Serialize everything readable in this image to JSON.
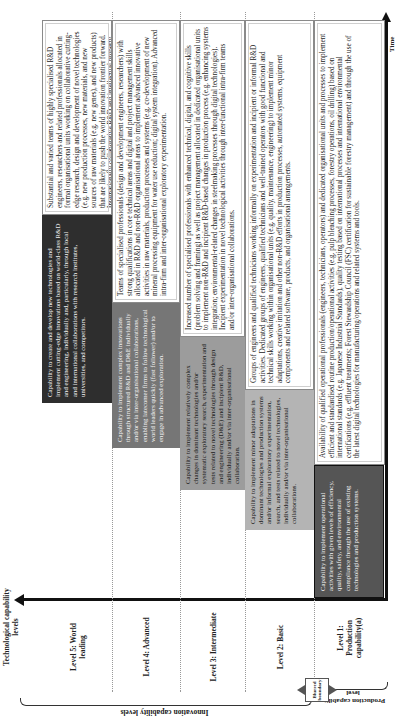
{
  "axes": {
    "y_title": "Technological capability levels",
    "x_title": "Time"
  },
  "levels": [
    {
      "id": 5,
      "label": "Level 5: World leading",
      "capability": "Capability to create and develop new technologies and implement cutting-edge innovations based on world-class R&D and engineering, individually and, particularly, through local and international collaborations with research institutes, universities, and competitors.",
      "description": "Substantial and varied teams of highly specialised R&D engineers, researchers and related professionals allocated in formal organisational units working on collaborative cutting-edge research, design and development of novel technologies (e.g. new production processes, new materials, and new sources of raw materials (e.g. new genes), and new products) that are likely to push the world innovation frontier forward. Internationally collaborative R&D and intellectual property structures."
    },
    {
      "id": 4,
      "label": "Level 4: Advanced",
      "capability": "Capability to implement complex innovations through structured R&D and D&E individually and/or via inter-organisational collaborations, enabling latecomer firms to follow technological world leaders quickly (fast follower) and/or to engage in advanced exploration.",
      "description": "Teams of specialised professionals (design and development engineers, researchers) with strong qualifications in core technical areas and digital and project management skills allocated in R&D and non-R&D organisational areas to implement advanced innovative activities in raw materials, production processes and systems (e.g. co-development of new mineral processing equipment for water use reduction; digital system integration). Advanced intra-firm and inter-organisational exploratory experimentation."
    },
    {
      "id": 3,
      "label": "Level 3: Intermediate",
      "capability": "Capability to implement relatively complex changes in dominant technologies and/or systematic exploratory search, experimentation and tests related to novel technologies through design and engineering (D&E) and incipient R&D, individually and/or via inter-organisational collaboration.",
      "description": "Increased number of specialised professionals with enhanced technical, digital, and cognitive skills (problem solving and framing) as well as project management allocated in dedicated organisational units to implement non-R&D and incipient R&D-based changes in production process (e.g. enhancing systems integration; environmental-related changes in steelmaking processes through digital technologies). Incipient experimentation in novel technological activities through inter-functional intra-firm teams and/or inter-organisational collaborations."
    },
    {
      "id": 2,
      "label": "Level 2: Basic",
      "capability": "Capability to implement minor adaptations in dominant technologies and production systems and/or informal exploratory experimentation, search, and tests related to novel technologies, individually and/or via inter-organisational collaborations.",
      "description": "Groups of engineers and qualified technicians working informally on experimentation and incipient or informal R&D activities. Dedicated groups of engineers, qualified technicians and well-trained operators with good functional and technical skills working within organisational units (e.g. quality, maintenance, engineering) to implement minor adaptations, creative imitation and other non-R&D efforts in production processes, automated systems, equipment components and related software, products, and organisational arrangements."
    },
    {
      "id": 1,
      "label": "Level 1: Production capability(a)",
      "capability": "Capability to implement operational activities with given levels of efficiency, quality, safety, and environmental compliance through the use of existing technologies and production systems.",
      "description": "Availability of qualified operational professionals (engineers, technicians, operators) and dedicated organisational units and processes to implement efficient and standardised routine production/operational activities (e.g. pulp bleaching processes, forestry operations, oil drilling) based on international standards (e.g. Japanese Industrial Standards), quality testing based on international processes and international environmental certifications (e.g. effluent treatments; Forest Stewardship Council (FSC) certification for sustainable forestry management) and through the use of the latest digital technologies for manufacturing/operations and related systems and tools."
    }
  ],
  "brackets": {
    "innovation": "Innovation capability levels",
    "production": "Production capability level",
    "boundary": "Blurred boundary"
  },
  "colors": {
    "level5_fill": "#2e2e2e",
    "level4_fill": "#767676",
    "level3_fill": "#9c9c9c",
    "level2_fill": "#b4b4b4",
    "level1_fill": "#555555"
  }
}
